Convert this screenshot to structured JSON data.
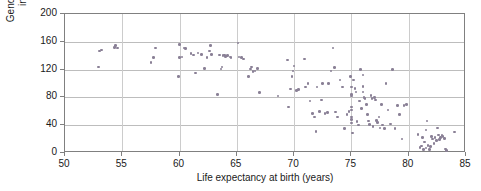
{
  "chart_data": {
    "type": "scatter",
    "title": "",
    "xlabel": "Life expectancy at birth (years)",
    "ylabel": "Gender inequality index rank",
    "ylabel_line1": "Gender inequality",
    "ylabel_line2": "index rank",
    "xlim": [
      50,
      85
    ],
    "ylim": [
      0,
      200
    ],
    "xticks": [
      50,
      55,
      60,
      65,
      70,
      75,
      80,
      85
    ],
    "yticks": [
      0,
      40,
      80,
      120,
      160,
      200
    ],
    "grid": "horizontal-and-vertical",
    "legend": "none",
    "marker_color": "#8a8096",
    "points": [
      [
        52.9,
        124
      ],
      [
        53.0,
        147
      ],
      [
        53.2,
        148
      ],
      [
        54.3,
        152
      ],
      [
        54.4,
        155
      ],
      [
        54.6,
        151
      ],
      [
        57.5,
        130
      ],
      [
        57.7,
        137
      ],
      [
        57.9,
        151
      ],
      [
        59.9,
        110
      ],
      [
        60.0,
        156
      ],
      [
        60.0,
        137
      ],
      [
        60.2,
        138
      ],
      [
        60.4,
        151
      ],
      [
        60.5,
        150
      ],
      [
        61.0,
        143
      ],
      [
        61.2,
        141
      ],
      [
        61.4,
        115
      ],
      [
        61.6,
        144
      ],
      [
        61.9,
        142
      ],
      [
        62.2,
        122
      ],
      [
        62.4,
        137
      ],
      [
        62.6,
        147
      ],
      [
        62.7,
        155
      ],
      [
        62.8,
        142
      ],
      [
        63.3,
        84
      ],
      [
        63.5,
        141
      ],
      [
        63.6,
        121
      ],
      [
        63.7,
        124
      ],
      [
        63.8,
        140
      ],
      [
        63.9,
        141
      ],
      [
        64.0,
        139
      ],
      [
        64.2,
        140
      ],
      [
        64.4,
        138
      ],
      [
        64.5,
        137
      ],
      [
        65.1,
        158
      ],
      [
        65.2,
        138
      ],
      [
        65.4,
        137
      ],
      [
        65.6,
        135
      ],
      [
        66.0,
        110
      ],
      [
        66.2,
        121
      ],
      [
        66.3,
        124
      ],
      [
        66.4,
        117
      ],
      [
        66.6,
        118
      ],
      [
        66.8,
        122
      ],
      [
        67.0,
        87
      ],
      [
        68.6,
        82
      ],
      [
        69.4,
        134
      ],
      [
        69.5,
        66
      ],
      [
        69.7,
        92
      ],
      [
        69.8,
        110
      ],
      [
        69.9,
        118
      ],
      [
        70.0,
        125
      ],
      [
        70.2,
        90
      ],
      [
        70.4,
        91
      ],
      [
        70.9,
        135
      ],
      [
        71.0,
        95
      ],
      [
        71.2,
        100
      ],
      [
        71.4,
        75
      ],
      [
        71.6,
        57
      ],
      [
        71.8,
        52
      ],
      [
        71.9,
        31
      ],
      [
        72.0,
        95
      ],
      [
        72.2,
        60
      ],
      [
        72.4,
        76
      ],
      [
        72.5,
        100
      ],
      [
        72.7,
        57
      ],
      [
        72.9,
        58
      ],
      [
        73.0,
        100
      ],
      [
        73.2,
        118
      ],
      [
        73.4,
        151
      ],
      [
        73.5,
        123
      ],
      [
        73.6,
        59
      ],
      [
        73.8,
        52
      ],
      [
        74.0,
        105
      ],
      [
        74.2,
        95
      ],
      [
        74.4,
        35
      ],
      [
        74.6,
        55
      ],
      [
        74.8,
        60
      ],
      [
        74.9,
        110
      ],
      [
        75.0,
        84
      ],
      [
        75.0,
        82
      ],
      [
        75.0,
        95
      ],
      [
        75.0,
        66
      ],
      [
        75.0,
        62
      ],
      [
        75.0,
        52
      ],
      [
        75.0,
        48
      ],
      [
        75.0,
        43
      ],
      [
        75.1,
        29
      ],
      [
        75.2,
        105
      ],
      [
        75.3,
        93
      ],
      [
        75.4,
        88
      ],
      [
        75.5,
        45
      ],
      [
        75.6,
        40
      ],
      [
        75.7,
        75
      ],
      [
        75.8,
        120
      ],
      [
        75.9,
        64
      ],
      [
        76.0,
        112
      ],
      [
        76.0,
        96
      ],
      [
        76.0,
        88
      ],
      [
        76.1,
        80
      ],
      [
        76.2,
        78
      ],
      [
        76.3,
        70
      ],
      [
        76.4,
        55
      ],
      [
        76.5,
        46
      ],
      [
        76.6,
        41
      ],
      [
        76.7,
        83
      ],
      [
        76.8,
        78
      ],
      [
        76.9,
        38
      ],
      [
        77.0,
        80
      ],
      [
        77.1,
        76
      ],
      [
        77.2,
        47
      ],
      [
        77.3,
        44
      ],
      [
        77.4,
        52
      ],
      [
        77.5,
        36
      ],
      [
        77.6,
        70
      ],
      [
        77.7,
        40
      ],
      [
        77.9,
        35
      ],
      [
        78.0,
        100
      ],
      [
        78.2,
        62
      ],
      [
        78.4,
        42
      ],
      [
        78.6,
        120
      ],
      [
        78.8,
        35
      ],
      [
        79.0,
        68
      ],
      [
        79.2,
        55
      ],
      [
        79.4,
        20
      ],
      [
        79.6,
        68
      ],
      [
        79.8,
        70
      ],
      [
        80.8,
        27
      ],
      [
        81.0,
        8
      ],
      [
        81.1,
        10
      ],
      [
        81.2,
        22
      ],
      [
        81.3,
        5
      ],
      [
        81.4,
        16
      ],
      [
        81.5,
        33
      ],
      [
        81.5,
        7
      ],
      [
        81.6,
        46
      ],
      [
        81.7,
        11
      ],
      [
        81.8,
        5
      ],
      [
        81.9,
        9
      ],
      [
        82.0,
        24
      ],
      [
        82.1,
        20
      ],
      [
        82.2,
        14
      ],
      [
        82.3,
        22
      ],
      [
        82.4,
        18
      ],
      [
        82.5,
        36
      ],
      [
        82.6,
        26
      ],
      [
        82.7,
        19
      ],
      [
        82.8,
        22
      ],
      [
        82.9,
        25
      ],
      [
        83.0,
        24
      ],
      [
        83.1,
        21
      ],
      [
        83.2,
        6
      ],
      [
        83.3,
        4
      ],
      [
        84.0,
        30
      ]
    ]
  }
}
